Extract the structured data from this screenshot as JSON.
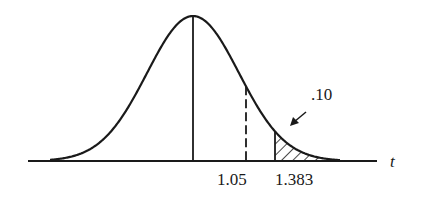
{
  "figure": {
    "type": "t-distribution density curve",
    "axis_variable": "t",
    "tick_labels": [
      "1.05",
      "1.383"
    ],
    "shaded_area_label": ".10",
    "colors": {
      "ink": "#1a1a1a",
      "background": "#ffffff"
    }
  },
  "chart_data": {
    "type": "area",
    "title": "",
    "xlabel": "t",
    "ylabel": "",
    "curve": "symmetric bell-shaped (t) density centered at 0",
    "reference_lines": [
      {
        "position": "center (mean 0)",
        "style": "solid"
      },
      {
        "value": 1.05,
        "style": "dashed",
        "label": "1.05"
      },
      {
        "value": 1.383,
        "style": "solid",
        "label": "1.383"
      }
    ],
    "shaded_region": {
      "from": 1.383,
      "to": "infinity",
      "area": 0.1,
      "label": ".10"
    },
    "x_tick_labels": [
      "1.05",
      "1.383"
    ],
    "grid": false
  }
}
